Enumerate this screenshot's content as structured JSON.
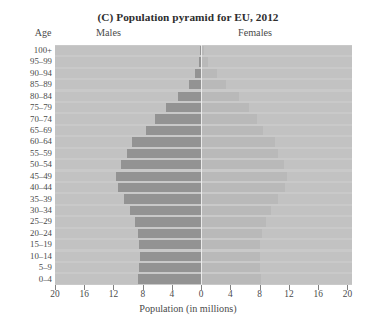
{
  "chart_data": {
    "type": "bar",
    "subtype": "population-pyramid",
    "title": "(C) Population pyramid for EU, 2012",
    "title_prefix": "(C)",
    "title_rest": " Population pyramid for EU, 2012",
    "xlabel": "Population (in millions)",
    "ylabel": "Age",
    "left_series_label": "Males",
    "right_series_label": "Females",
    "grid": false,
    "legend_position": "top-inline",
    "axis_max": 20,
    "xlim": [
      -20,
      20
    ],
    "xticks": [
      20,
      16,
      12,
      8,
      4,
      0,
      4,
      8,
      12,
      16,
      20
    ],
    "categories": [
      "100+",
      "95–99",
      "90–94",
      "85–89",
      "80–84",
      "75–79",
      "70–74",
      "65–69",
      "60–64",
      "55–59",
      "50–54",
      "45–49",
      "40–44",
      "35–39",
      "30–34",
      "25–29",
      "20–24",
      "15–19",
      "10–14",
      "5–9",
      "0–4"
    ],
    "series": [
      {
        "name": "Males",
        "side": "left",
        "color": "#939393",
        "values": [
          0.1,
          0.3,
          0.8,
          1.7,
          3.2,
          4.8,
          6.3,
          7.6,
          9.4,
          10.1,
          11.0,
          11.7,
          11.4,
          10.5,
          9.7,
          9.1,
          8.6,
          8.5,
          8.4,
          8.5,
          8.6
        ]
      },
      {
        "name": "Females",
        "side": "right",
        "color": "#b9b9b9",
        "values": [
          0.4,
          0.9,
          2.1,
          3.4,
          5.2,
          6.6,
          7.7,
          8.5,
          10.1,
          10.5,
          11.3,
          11.8,
          11.4,
          10.5,
          9.6,
          8.9,
          8.3,
          8.1,
          8.0,
          8.1,
          8.2
        ]
      }
    ],
    "plot_background": "#c9c9c9",
    "row_band_color": "#c2c2c2",
    "center_line_color": "#ebebeb"
  }
}
